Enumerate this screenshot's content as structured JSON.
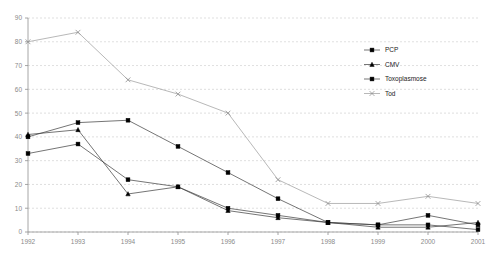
{
  "chart_data": {
    "type": "line",
    "title": "",
    "subtitle": "",
    "xlabel": "",
    "ylabel": "",
    "categories": [
      "1992",
      "1993",
      "1994",
      "1995",
      "1996",
      "1997",
      "1998",
      "1999",
      "2000",
      "2001"
    ],
    "x": [
      1992,
      1993,
      1994,
      1995,
      1996,
      1997,
      1998,
      1999,
      2000,
      2001
    ],
    "ylim": [
      0,
      90
    ],
    "yticks": [
      0,
      10,
      20,
      30,
      40,
      50,
      60,
      70,
      80,
      90
    ],
    "grid": true,
    "legend_position": "top-right",
    "series": [
      {
        "name": "PCP",
        "marker": "square",
        "color": "#000000",
        "values": [
          40,
          46,
          47,
          36,
          25,
          14,
          4,
          3,
          7,
          3
        ]
      },
      {
        "name": "CMV",
        "marker": "triangle",
        "color": "#000000",
        "values": [
          41,
          43,
          16,
          19,
          9,
          6,
          4,
          2,
          2,
          4
        ]
      },
      {
        "name": "Toxoplasmose",
        "marker": "square",
        "color": "#000000",
        "values": [
          33,
          37,
          22,
          19,
          10,
          7,
          4,
          3,
          3,
          1
        ]
      },
      {
        "name": "Tod",
        "marker": "x",
        "color": "#8f8f8f",
        "values": [
          80,
          84,
          64,
          58,
          50,
          22,
          12,
          12,
          15,
          12
        ]
      }
    ]
  },
  "axes": {
    "y_tick_labels": [
      "90",
      "80",
      "70",
      "60",
      "50",
      "40",
      "30",
      "20",
      "10",
      "0"
    ],
    "x_tick_labels": [
      "1992",
      "1993",
      "1994",
      "1995",
      "1996",
      "1997",
      "1998",
      "1999",
      "2000",
      "2001"
    ]
  },
  "legend": {
    "items": [
      {
        "label": "PCP",
        "marker": "square-marker-icon"
      },
      {
        "label": "CMV",
        "marker": "triangle-marker-icon"
      },
      {
        "label": "Toxoplasmose",
        "marker": "square-marker-icon"
      },
      {
        "label": "Tod",
        "marker": "x-marker-icon"
      }
    ]
  },
  "colors": {
    "grid": "#c9c9c9",
    "axis": "#909090",
    "series_dark": "#3a3a3a",
    "series_light": "#9a9a9a",
    "tick_text": "#8a8a8a",
    "legend_text": "#222222",
    "background": "#ffffff"
  }
}
